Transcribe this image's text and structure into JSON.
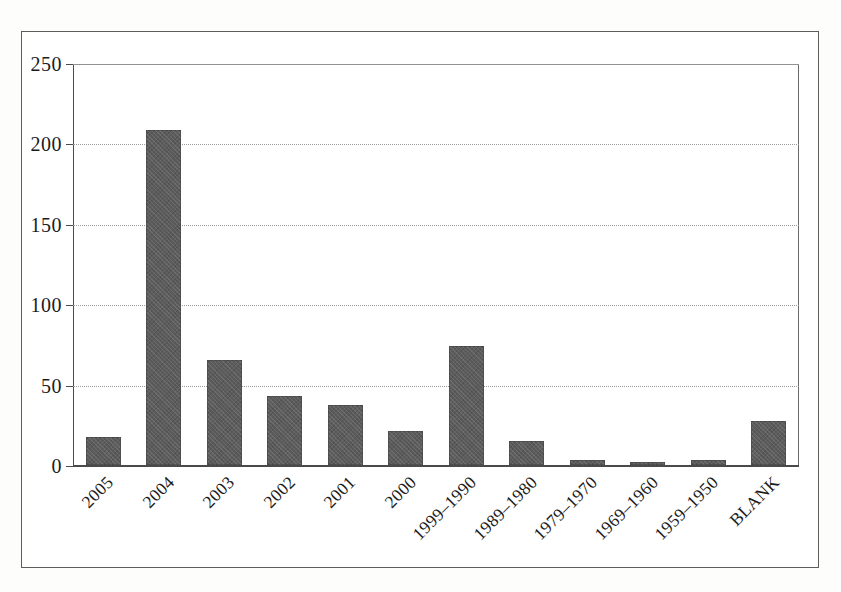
{
  "chart_data": {
    "type": "bar",
    "title": "",
    "subtitle": "",
    "xlabel": "",
    "ylabel": "",
    "categories": [
      "2005",
      "2004",
      "2003",
      "2002",
      "2001",
      "2000",
      "1999–1990",
      "1989–1980",
      "1979–1970",
      "1969–1960",
      "1959–1950",
      "BLANK"
    ],
    "values": [
      17,
      208,
      65,
      43,
      37,
      21,
      74,
      15,
      3,
      1.5,
      3,
      27
    ],
    "ylim": [
      0,
      250
    ],
    "yticks": [
      0,
      50,
      100,
      150,
      200,
      250
    ],
    "ytick_labels": [
      "0",
      "50",
      "100",
      "150",
      "200",
      "250"
    ],
    "grid": true,
    "grid_axis": "y",
    "legend": false,
    "legend_position": "none",
    "bar_color": "#5c5c5c",
    "axis_color": "#4a4a4a",
    "gridline_color": "#9a9a9a",
    "background_color": "#ffffff",
    "xtick_rotation": -45
  },
  "figure": {
    "frame_border_color": "#5d5d5d",
    "page_background": "#fdfdfc"
  }
}
